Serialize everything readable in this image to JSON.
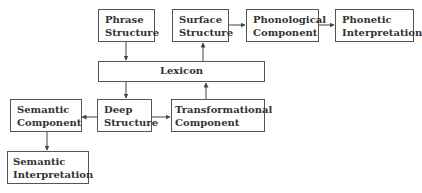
{
  "diagram": {
    "nodes": [
      {
        "id": "phrase_structure",
        "lines": [
          "Phrase",
          "Structure"
        ]
      },
      {
        "id": "surface_structure",
        "lines": [
          "Surface",
          "Structure"
        ]
      },
      {
        "id": "phonological_component",
        "lines": [
          "Phonological",
          "Component"
        ]
      },
      {
        "id": "phonetic_interpretation",
        "lines": [
          "Phonetic",
          "Interpretation"
        ]
      },
      {
        "id": "lexicon",
        "lines": [
          "Lexicon"
        ]
      },
      {
        "id": "semantic_component",
        "lines": [
          "Semantic",
          "Component"
        ]
      },
      {
        "id": "deep_structure",
        "lines": [
          "Deep",
          "Structure"
        ]
      },
      {
        "id": "transformational_component",
        "lines": [
          "Transformational",
          "Component"
        ]
      },
      {
        "id": "semantic_interpretation",
        "lines": [
          "Semantic",
          "Interpretation"
        ]
      }
    ],
    "edges": [
      {
        "from": "phrase_structure",
        "to": "lexicon"
      },
      {
        "from": "lexicon",
        "to": "deep_structure"
      },
      {
        "from": "deep_structure",
        "to": "semantic_component"
      },
      {
        "from": "semantic_component",
        "to": "semantic_interpretation"
      },
      {
        "from": "deep_structure",
        "to": "transformational_component"
      },
      {
        "from": "transformational_component",
        "to": "lexicon"
      },
      {
        "from": "lexicon",
        "to": "surface_structure"
      },
      {
        "from": "surface_structure",
        "to": "phonological_component"
      },
      {
        "from": "phonological_component",
        "to": "phonetic_interpretation"
      }
    ],
    "colors": {
      "border": "#555555",
      "text": "#333333",
      "arrow": "#444444"
    }
  }
}
